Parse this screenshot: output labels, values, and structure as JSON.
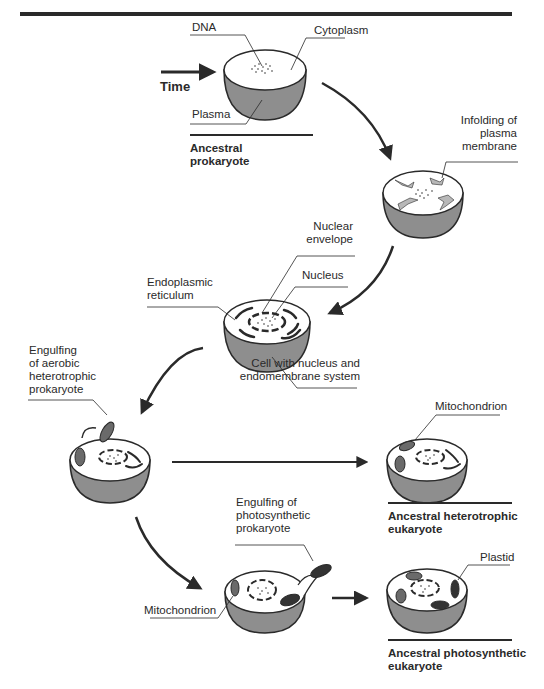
{
  "diagram": {
    "time_label": "Time",
    "stages": [
      {
        "id": "ancestral-prokaryote",
        "caption": [
          "Ancestral",
          "prokaryote"
        ],
        "labels": {
          "dna": "DNA",
          "cytoplasm": "Cytoplasm",
          "plasma": "Plasma"
        }
      },
      {
        "id": "infolding",
        "labels": {
          "infolding": [
            "Infolding of",
            "plasma",
            "membrane"
          ]
        }
      },
      {
        "id": "nucleated-cell",
        "labels": {
          "nuclear_envelope": [
            "Nuclear",
            "envelope"
          ],
          "nucleus": "Nucleus",
          "er": [
            "Endoplasmic",
            "reticulum"
          ],
          "cell_desc": [
            "Cell with nucleus and",
            "endomembrane system"
          ]
        }
      },
      {
        "id": "engulfing-aerobic",
        "labels": {
          "engulfing": [
            "Engulfing",
            "of aerobic",
            "heterotrophic",
            "prokaryote"
          ]
        }
      },
      {
        "id": "ancestral-heterotrophic-eukaryote",
        "caption": [
          "Ancestral heterotrophic",
          "eukaryote"
        ],
        "labels": {
          "mitochondrion": "Mitochondrion"
        }
      },
      {
        "id": "engulfing-photosynthetic",
        "labels": {
          "engulfing": [
            "Engulfing of",
            "photosynthetic",
            "prokaryote"
          ],
          "mitochondrion": "Mitochondrion"
        }
      },
      {
        "id": "ancestral-photosynthetic-eukaryote",
        "caption": [
          "Ancestral photosynthetic",
          "eukaryote"
        ],
        "labels": {
          "plastid": "Plastid"
        }
      }
    ],
    "colors": {
      "line": "#2a2a2a",
      "cell_lower": "#8e8e8e",
      "cell_top": "#ffffff",
      "organelle_fill": "#6a6a6a",
      "membrane_fill": "#b8b8b8"
    }
  }
}
